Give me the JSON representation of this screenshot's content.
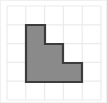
{
  "figure": {
    "title": "",
    "canvas": {
      "width": 107,
      "height": 103,
      "background_color": "#ffffff",
      "border_color": "#f0f0f0"
    },
    "grid": {
      "visible": true,
      "columns": 5,
      "rows": 5,
      "cell_size": 18.8,
      "origin_x": 7,
      "origin_y": 6,
      "line_color": "#ebebeb",
      "line_width": 1.2,
      "x_lines": [
        7,
        25.8,
        44.6,
        63.4,
        82.2,
        101
      ],
      "y_lines": [
        6,
        24.8,
        43.6,
        62.4,
        81.2,
        100
      ]
    },
    "shape": {
      "name": "staircase-polygon",
      "fill_color": "#8a8a8a",
      "stroke_color": "#3c3c3c",
      "stroke_width": 2.2,
      "cells_filled": 6,
      "column_heights": [
        3,
        2,
        1
      ],
      "points": "26,25 45,25 45,44 63,44 63,63 82,63 82,82 26,82",
      "vertices": [
        {
          "x": 26,
          "y": 25
        },
        {
          "x": 45,
          "y": 25
        },
        {
          "x": 45,
          "y": 44
        },
        {
          "x": 63,
          "y": 44
        },
        {
          "x": 63,
          "y": 63
        },
        {
          "x": 82,
          "y": 63
        },
        {
          "x": 82,
          "y": 82
        },
        {
          "x": 26,
          "y": 82
        }
      ]
    }
  }
}
